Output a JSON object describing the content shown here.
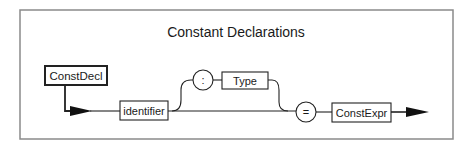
{
  "diagram": {
    "title": "Constant Declarations",
    "start_node": {
      "label": "ConstDecl",
      "kind": "nonterminal-start"
    },
    "nodes": [
      {
        "id": "identifier",
        "label": "identifier",
        "kind": "terminal-box"
      },
      {
        "id": "colon",
        "label": ":",
        "kind": "symbol-circle",
        "optional": true
      },
      {
        "id": "type",
        "label": "Type",
        "kind": "nonterminal-box",
        "optional": true
      },
      {
        "id": "equals",
        "label": "=",
        "kind": "symbol-circle"
      },
      {
        "id": "constexpr",
        "label": "ConstExpr",
        "kind": "nonterminal-box"
      }
    ],
    "edges": [
      [
        "ConstDecl",
        "identifier"
      ],
      [
        "identifier",
        "colon"
      ],
      [
        "colon",
        "type"
      ],
      [
        "type",
        "equals"
      ],
      [
        "identifier",
        "equals"
      ],
      [
        "equals",
        "constexpr"
      ],
      [
        "constexpr",
        "end"
      ]
    ],
    "colors": {
      "line": "#222222",
      "frame": "#8a8a8a",
      "background": "#ffffff"
    }
  }
}
